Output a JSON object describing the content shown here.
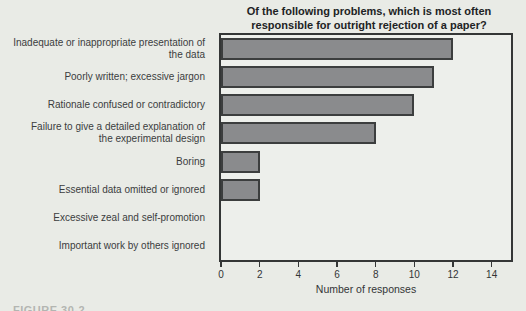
{
  "figure": {
    "caption_partial": "FIGURE 30-2"
  },
  "chart_data": {
    "type": "bar",
    "orientation": "horizontal",
    "title_lines": [
      "Of the following problems, which is most often",
      "responsible for outright rejection of a paper?"
    ],
    "categories": [
      "Inadequate or inappropriate presentation of\nthe data",
      "Poorly written; excessive jargon",
      "Rationale confused or contradictory",
      "Failure to give a detailed explanation of\nthe experimental design",
      "Boring",
      "Essential data omitted or ignored",
      "Excessive zeal and self-promotion",
      "Important work by others ignored"
    ],
    "values": [
      12,
      11,
      10,
      8,
      2,
      2,
      0,
      0
    ],
    "xlabel": "Number of responses",
    "xlim": [
      0,
      15
    ],
    "xticks": [
      0,
      2,
      4,
      6,
      8,
      10,
      12,
      14
    ],
    "grid": false,
    "legend": "none",
    "bar_color": "#8a8b8d",
    "bar_border_color": "#3c3e3e",
    "background": "#e9ebe6"
  }
}
